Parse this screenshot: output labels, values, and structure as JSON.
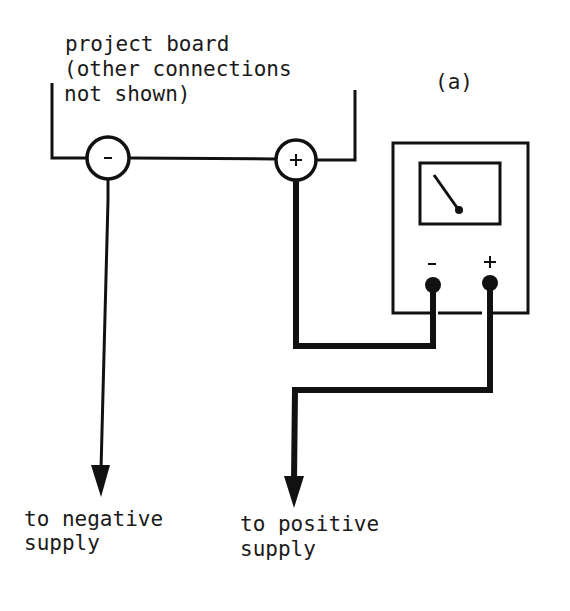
{
  "figure": {
    "panel_label": "(a)",
    "board": {
      "label_line1": "project board",
      "label_line2": "(other connections",
      "label_line3": "not shown)",
      "neg_terminal": "-",
      "pos_terminal": "+"
    },
    "meter": {
      "neg_terminal": "-",
      "pos_terminal": "+"
    },
    "outputs": {
      "negative_line1": "to negative",
      "negative_line2": "supply",
      "positive_line1": "to positive",
      "positive_line2": "supply"
    },
    "colors": {
      "ink": "#111111",
      "background": "#ffffff"
    }
  }
}
